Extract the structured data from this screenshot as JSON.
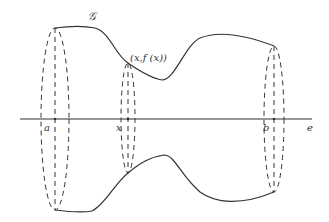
{
  "diagram": {
    "type": "solid of revolution",
    "colors": {
      "stroke": "#333333",
      "background": "#ffffff"
    },
    "labels": {
      "curve": "𝒢",
      "point": "(x,f (x))",
      "a": "a",
      "x": "x",
      "b": "b",
      "e": "e"
    }
  }
}
